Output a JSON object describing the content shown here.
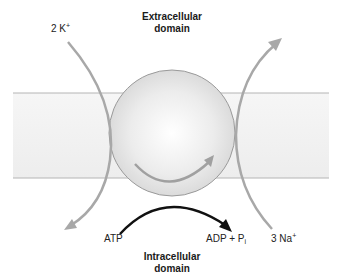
{
  "labels": {
    "extracellular_line1": "Extracellular",
    "extracellular_line2": "domain",
    "intracellular_line1": "Intracellular",
    "intracellular_line2": "domain",
    "potassium_prefix": "2 K",
    "potassium_charge": "+",
    "sodium_prefix": "3 Na",
    "sodium_charge": "+",
    "atp": "ATP",
    "adp_prefix": "ADP + P",
    "adp_subscript": "i"
  },
  "colors": {
    "membrane_fill": "#f0f0f0",
    "membrane_line": "#b4b4b4",
    "ion_arrow": "#a8a8a8",
    "sphere_edge": "#9a9a9a",
    "atp_arrow": "#111111"
  }
}
